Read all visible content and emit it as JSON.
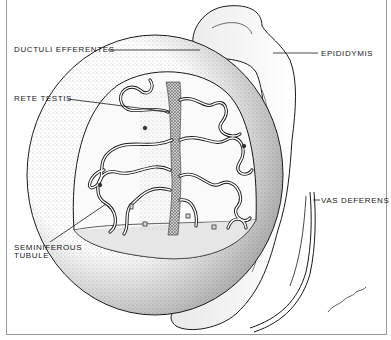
{
  "diagram": {
    "labels": {
      "ductuli_efferentes": "DUCTULI EFFERENTES",
      "rete_testis": "RETE TESTIS",
      "seminiferous_tubule_line1": "SEMINIFEROUS",
      "seminiferous_tubule_line2": "TUBULE",
      "epididymis": "EPIDIDYMIS",
      "vas_deferens": "VAS DEFERENS"
    },
    "signature": "artist signature",
    "colors": {
      "ink": "#1a1a1a",
      "background": "#ffffff",
      "frame": "#9a9a9a",
      "stipple": "#555555"
    }
  }
}
